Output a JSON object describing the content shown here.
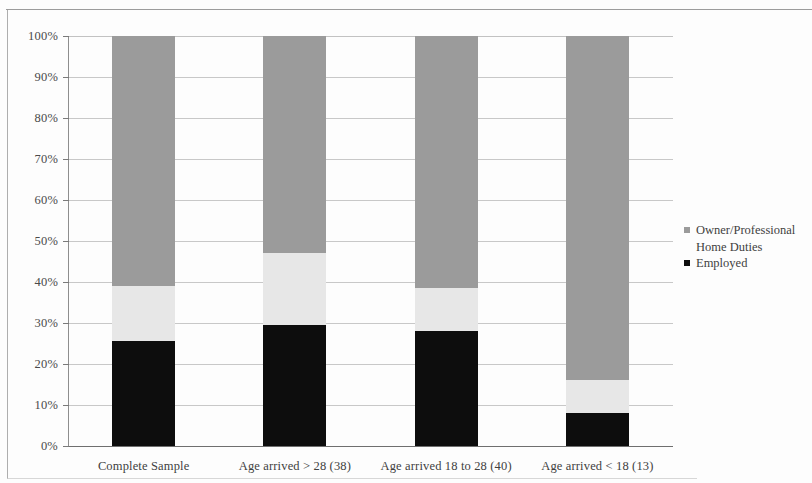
{
  "chart_data": {
    "type": "bar",
    "subtype": "stacked-100-percent",
    "title": "",
    "xlabel": "",
    "ylabel": "",
    "ylim": [
      0,
      100
    ],
    "grid": true,
    "legend_position": "right",
    "categories": [
      "Complete Sample",
      "Age arrived > 28 (38)",
      "Age arrived 18 to 28 (40)",
      "Age arrived < 18 (13)"
    ],
    "ytick_labels": [
      "0%",
      "10%",
      "20%",
      "30%",
      "40%",
      "50%",
      "60%",
      "70%",
      "80%",
      "90%",
      "100%"
    ],
    "ytick_values": [
      0,
      10,
      20,
      30,
      40,
      50,
      60,
      70,
      80,
      90,
      100
    ],
    "series": [
      {
        "name": "Employed",
        "color": "#0d0d0d",
        "values": [
          25.5,
          29.5,
          28.0,
          8.0
        ]
      },
      {
        "name": "Home Duties",
        "color": "#e7e7e7",
        "values": [
          13.5,
          17.5,
          10.5,
          8.0
        ]
      },
      {
        "name": "Owner/Professional",
        "color": "#9b9b9b",
        "values": [
          61.0,
          53.0,
          61.5,
          84.0
        ]
      }
    ],
    "legend_entries": [
      {
        "label": "Owner/Professional",
        "color": "#9b9b9b"
      },
      {
        "label": "Home Duties",
        "color": "#e7e7e7"
      },
      {
        "label": "Employed",
        "color": "#0d0d0d"
      }
    ],
    "legend_display": {
      "line1": "Owner/Professional",
      "line2": "Home Duties",
      "line3": "Employed"
    }
  }
}
